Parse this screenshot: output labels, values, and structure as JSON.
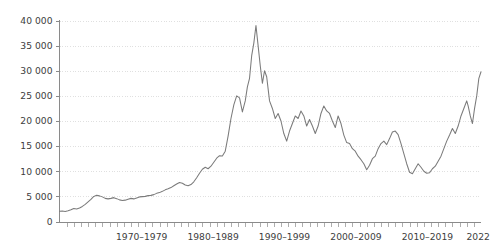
{
  "chart_data": {
    "type": "line",
    "title": "",
    "subtitle": "",
    "xlabel": "",
    "ylabel": "",
    "ylim": [
      0,
      40000
    ],
    "xlim": [
      1963,
      2022
    ],
    "grid": true,
    "legend": false,
    "legend_position": "none",
    "line_color": "#7b7b7b",
    "grid_color": "#d8d8d8",
    "axis_color": "#8a8a8a",
    "text_color": "#3d3d3d",
    "ytick_labels": [
      "0",
      "5 000",
      "10 000",
      "15 000",
      "20 000",
      "25 000",
      "30 000",
      "35 000",
      "40 000"
    ],
    "ytick_values": [
      0,
      5000,
      10000,
      15000,
      20000,
      25000,
      30000,
      35000,
      40000
    ],
    "xtick_labels": [
      "1970-1979",
      "1980-1989",
      "1990-1999",
      "2000-2009",
      "2010-2019",
      "2022"
    ],
    "xtick_centers": [
      1974.5,
      1984.5,
      1994.5,
      2004.5,
      2014.5,
      2021.6
    ],
    "minor_tick_start": 1964,
    "minor_tick_end": 2022,
    "minor_tick_step": 1,
    "series": [
      {
        "name": "index",
        "x": [
          1963.0,
          1963.4,
          1963.8,
          1964.2,
          1964.6,
          1965.0,
          1965.4,
          1965.8,
          1966.2,
          1966.6,
          1967.0,
          1967.4,
          1967.8,
          1968.2,
          1968.6,
          1969.0,
          1969.4,
          1969.8,
          1970.2,
          1970.6,
          1971.0,
          1971.4,
          1971.8,
          1972.2,
          1972.6,
          1973.0,
          1973.4,
          1973.8,
          1974.2,
          1974.6,
          1975.0,
          1975.4,
          1975.8,
          1976.2,
          1976.6,
          1977.0,
          1977.4,
          1977.8,
          1978.2,
          1978.6,
          1979.0,
          1979.4,
          1979.8,
          1980.2,
          1980.6,
          1981.0,
          1981.4,
          1981.8,
          1982.2,
          1982.6,
          1983.0,
          1983.4,
          1983.8,
          1984.2,
          1984.6,
          1985.0,
          1985.4,
          1985.8,
          1986.2,
          1986.6,
          1987.0,
          1987.4,
          1987.8,
          1988.2,
          1988.6,
          1989.0,
          1989.3,
          1989.6,
          1989.9,
          1990.2,
          1990.5,
          1990.8,
          1991.1,
          1991.4,
          1991.7,
          1992.0,
          1992.4,
          1992.8,
          1993.2,
          1993.6,
          1994.0,
          1994.4,
          1994.8,
          1995.2,
          1995.6,
          1996.0,
          1996.4,
          1996.8,
          1997.2,
          1997.6,
          1998.0,
          1998.4,
          1998.8,
          1999.2,
          1999.6,
          2000.0,
          2000.4,
          2000.8,
          2001.2,
          2001.6,
          2002.0,
          2002.4,
          2002.8,
          2003.2,
          2003.6,
          2004.0,
          2004.4,
          2004.8,
          2005.2,
          2005.6,
          2006.0,
          2006.4,
          2006.8,
          2007.2,
          2007.6,
          2008.0,
          2008.4,
          2008.8,
          2009.2,
          2009.6,
          2010.0,
          2010.4,
          2010.8,
          2011.2,
          2011.6,
          2012.0,
          2012.4,
          2012.8,
          2013.2,
          2013.6,
          2014.0,
          2014.4,
          2014.8,
          2015.2,
          2015.6,
          2016.0,
          2016.4,
          2016.8,
          2017.2,
          2017.6,
          2018.0,
          2018.4,
          2018.8,
          2019.2,
          2019.6,
          2020.0,
          2020.2,
          2020.5,
          2020.8,
          2021.1,
          2021.4,
          2021.7,
          2022.0
        ],
        "values": [
          2050,
          2100,
          2000,
          2150,
          2350,
          2600,
          2500,
          2700,
          3000,
          3400,
          3900,
          4400,
          5000,
          5200,
          5100,
          4900,
          4600,
          4500,
          4600,
          4750,
          4550,
          4300,
          4200,
          4250,
          4450,
          4600,
          4500,
          4700,
          4900,
          4950,
          5000,
          5150,
          5200,
          5350,
          5600,
          5750,
          6000,
          6300,
          6500,
          6750,
          7100,
          7450,
          7750,
          7600,
          7250,
          7100,
          7350,
          7900,
          8700,
          9600,
          10400,
          10800,
          10500,
          11000,
          11800,
          12600,
          13100,
          13050,
          14000,
          17000,
          20500,
          23200,
          25000,
          24600,
          21800,
          24000,
          26800,
          28500,
          33000,
          35500,
          39000,
          35000,
          31000,
          27500,
          30000,
          28800,
          24000,
          22500,
          20500,
          21500,
          20000,
          17500,
          16000,
          18000,
          19500,
          21000,
          20500,
          22000,
          21000,
          19000,
          20300,
          19000,
          17500,
          19000,
          21500,
          23000,
          22000,
          21500,
          20000,
          18700,
          21000,
          19500,
          17200,
          15700,
          15500,
          14500,
          14000,
          13000,
          12300,
          11500,
          10300,
          11200,
          12500,
          13000,
          14500,
          15500,
          16000,
          15300,
          16500,
          17800,
          18000,
          17300,
          15500,
          13500,
          11500,
          9800,
          9500,
          10500,
          11500,
          10800,
          10000,
          9600,
          9700,
          10500,
          11000,
          12000,
          13000,
          14500,
          16000,
          17200,
          18500,
          17500,
          19000,
          21000,
          22500,
          24000,
          23000,
          21000,
          19500,
          22500,
          25000,
          28500,
          29800
        ]
      }
    ],
    "annotations": []
  }
}
